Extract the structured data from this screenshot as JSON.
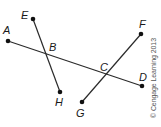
{
  "diagram": {
    "type": "geometry-line-segments",
    "points": {
      "A": {
        "label": "A",
        "x": 8,
        "y": 41,
        "lx": 3,
        "ly": 34
      },
      "B": {
        "label": "B",
        "x": 46,
        "y": 53,
        "lx": 49,
        "ly": 51
      },
      "C": {
        "label": "C",
        "x": 106,
        "y": 75,
        "lx": 100,
        "ly": 71
      },
      "D": {
        "label": "D",
        "x": 142,
        "y": 86,
        "lx": 139,
        "ly": 81
      },
      "E": {
        "label": "E",
        "x": 33,
        "y": 19,
        "lx": 21,
        "ly": 19
      },
      "F": {
        "label": "F",
        "x": 141,
        "y": 34,
        "lx": 139,
        "ly": 28
      },
      "G": {
        "label": "G",
        "x": 82,
        "y": 102,
        "lx": 76,
        "ly": 117
      },
      "H": {
        "label": "H",
        "x": 60,
        "y": 92,
        "lx": 55,
        "ly": 106
      }
    },
    "segments": [
      {
        "from": "A",
        "to": "D"
      },
      {
        "from": "E",
        "to": "H"
      },
      {
        "from": "F",
        "to": "G"
      }
    ],
    "intersections": [
      {
        "point": "B",
        "segments": [
          "A-D",
          "E-H"
        ]
      },
      {
        "point": "C",
        "segments": [
          "A-D",
          "F-G"
        ]
      }
    ],
    "endpoints": [
      "A",
      "D",
      "E",
      "H",
      "F",
      "G"
    ],
    "line_color": "#2a2a2a",
    "dot_color": "#111111"
  },
  "copyright": "© Cengage Learning 2013"
}
